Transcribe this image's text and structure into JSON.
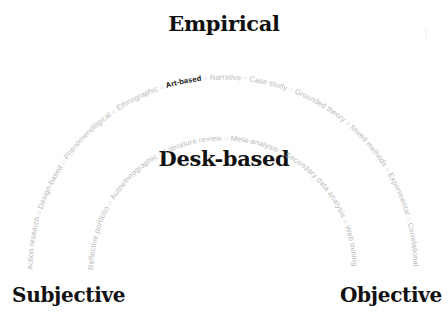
{
  "headings": {
    "top": "Empirical",
    "middle": "Desk-based",
    "left": "Subjective",
    "right": "Objective"
  },
  "outer_arc": {
    "label": "Empirical methods",
    "items": [
      {
        "label": "Action research",
        "active": false
      },
      {
        "label": "Design-based",
        "active": false
      },
      {
        "label": "Phenomenological",
        "active": false
      },
      {
        "label": "Ethnographic",
        "active": false
      },
      {
        "label": "Art-based",
        "active": true
      },
      {
        "label": "Narrative",
        "active": false
      },
      {
        "label": "Case study",
        "active": false
      },
      {
        "label": "Grounded theory",
        "active": false
      },
      {
        "label": "Mixed methods",
        "active": false
      },
      {
        "label": "Experimental",
        "active": false
      },
      {
        "label": "Correlational",
        "active": false
      }
    ]
  },
  "inner_arc": {
    "label": "Desk-based methods",
    "items": [
      {
        "label": "Reflective portfolio",
        "active": false
      },
      {
        "label": "Autoethnographic",
        "active": false
      },
      {
        "label": "Literature review",
        "active": false
      },
      {
        "label": "Meta-analysis",
        "active": false
      },
      {
        "label": "Secondary data analysis",
        "active": false
      },
      {
        "label": "Web mining",
        "active": false
      }
    ]
  },
  "separator_glyph": "○",
  "colors": {
    "heading": "#111111",
    "inactive_label": "#b9b9b9",
    "active_label": "#111111",
    "background": "#ffffff"
  }
}
